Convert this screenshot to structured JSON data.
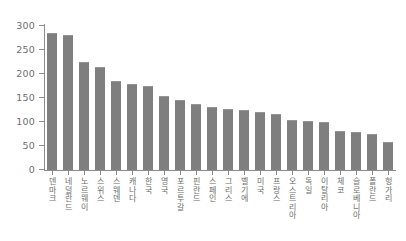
{
  "chart_data": {
    "type": "bar",
    "title": "",
    "subtitle": "",
    "xlabel": "",
    "ylabel": "",
    "ylim": [
      0,
      300
    ],
    "yticks": [
      0,
      50,
      100,
      150,
      200,
      250,
      300
    ],
    "grid": false,
    "legend": null,
    "bar_color": "#7f7f7f",
    "axis_color": "#8d8d8d",
    "text_color": "#6e6e6e",
    "categories": [
      "덴마크",
      "네덜란드",
      "노르웨이",
      "스위스",
      "스웨덴",
      "캐나다",
      "한국",
      "영국",
      "포르투갈",
      "핀란드",
      "스페인",
      "그리스",
      "벨기에",
      "미국",
      "프랑스",
      "오스트리아",
      "독일",
      "이탈리아",
      "체코",
      "슬로베니아",
      "폴란드",
      "헝가리"
    ],
    "values": [
      283,
      279,
      222,
      213,
      183,
      178,
      172,
      153,
      143,
      136,
      130,
      125,
      123,
      118,
      115,
      103,
      100,
      98,
      80,
      78,
      72,
      57
    ]
  }
}
